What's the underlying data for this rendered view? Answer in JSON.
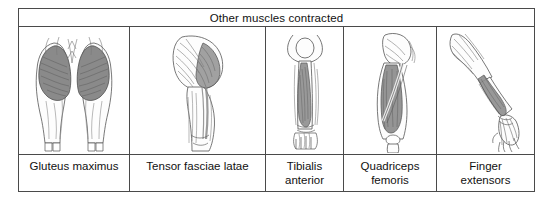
{
  "figure": {
    "header": {
      "title": "Other muscles contracted"
    },
    "columns": [
      {
        "label": "Gluteus maximus",
        "illustration": "gluteus-maximus-posterior-legs",
        "view": "posterior view of both thighs and buttocks",
        "highlight_color": "#8a8a8a"
      },
      {
        "label": "Tensor fasciae latae",
        "illustration": "tensor-fasciae-latae-lateral-hip",
        "view": "lateral view of hip and thigh",
        "highlight_color": "#8a8a8a"
      },
      {
        "label": "Tibialis\nanterior",
        "illustration": "tibialis-anterior-lower-leg",
        "view": "anterior view of lower leg and foot",
        "highlight_color": "#8a8a8a"
      },
      {
        "label": "Quadriceps\nfemoris",
        "illustration": "quadriceps-femoris-anterior-thigh",
        "view": "anterior view of thigh",
        "highlight_color": "#8a8a8a"
      },
      {
        "label": "Finger\nextensors",
        "illustration": "finger-extensors-posterior-forearm",
        "view": "posterior view of forearm and hand",
        "highlight_color": "#8a8a8a"
      }
    ]
  },
  "colors": {
    "border": "#4a4a4a",
    "background": "#ffffff",
    "text": "#111111",
    "muscle_shade": "#8a8a8a",
    "muscle_shade_dark": "#6b6b6b",
    "outline": "#555555"
  }
}
